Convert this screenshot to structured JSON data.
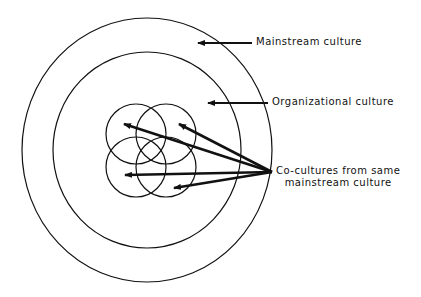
{
  "diagram": {
    "labels": {
      "mainstream": "Mainstream culture",
      "organizational": "Organizational culture",
      "cocultures_line1": "Co-cultures from same",
      "cocultures_line2": "mainstream culture"
    },
    "colors": {
      "stroke": "#111111",
      "background": "#ffffff"
    },
    "shapes": {
      "outer_circle": {
        "cx": 147,
        "cy": 150,
        "rx": 125,
        "ry": 132
      },
      "middle_circle": {
        "cx": 147,
        "cy": 150,
        "rx": 94,
        "ry": 98
      },
      "co_culture_circles": [
        {
          "cx": 136,
          "cy": 134,
          "r": 30
        },
        {
          "cx": 166,
          "cy": 134,
          "r": 30
        },
        {
          "cx": 136,
          "cy": 167,
          "r": 30
        },
        {
          "cx": 166,
          "cy": 167,
          "r": 30
        }
      ]
    },
    "arrows": [
      {
        "from": "mainstream-label",
        "x1": 252,
        "y1": 43,
        "x2": 196,
        "y2": 43
      },
      {
        "from": "organizational-label",
        "x1": 268,
        "y1": 103,
        "x2": 206,
        "y2": 103
      },
      {
        "from": "cocultures-label",
        "x1": 272,
        "y1": 172,
        "x2": 122,
        "y2": 124
      },
      {
        "from": "cocultures-label",
        "x1": 272,
        "y1": 172,
        "x2": 177,
        "y2": 124
      },
      {
        "from": "cocultures-label",
        "x1": 272,
        "y1": 172,
        "x2": 123,
        "y2": 175
      },
      {
        "from": "cocultures-label",
        "x1": 272,
        "y1": 172,
        "x2": 172,
        "y2": 188
      }
    ]
  }
}
